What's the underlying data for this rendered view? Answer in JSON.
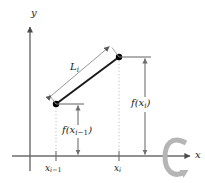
{
  "figure": {
    "type": "math-diagram",
    "axes": {
      "x_label": "x",
      "y_label": "y",
      "origin_px": [
        30,
        156
      ]
    },
    "labels": {
      "segment_length": "L",
      "segment_length_sub": "i",
      "f_left_name": "f(x",
      "f_left_sub": "i",
      "f_left_sub_op": "−1",
      "f_left_close": ")",
      "f_right_name": "f(x",
      "f_right_sub": "i",
      "f_right_close": ")",
      "tick_left": "x",
      "tick_left_sub": "i",
      "tick_left_sub_op": "−1",
      "tick_right": "x",
      "tick_right_sub": "i"
    },
    "colors": {
      "axis": "#6b6b6b",
      "curve": "#1a1a1a",
      "point": "#000000",
      "guide": "#9a9a9a",
      "dimension": "#7d7d7d",
      "dotted": "#b8b8b8",
      "rotation": "#b5b5b5",
      "text": "#1a1a1a",
      "background": "#ffffff"
    },
    "geometry": {
      "point_left_px": [
        56,
        104
      ],
      "point_right_px": [
        119,
        57
      ],
      "tick_left_x_px": 56,
      "tick_right_x_px": 119,
      "f_left_arrow_x_px": 78,
      "f_right_arrow_x_px": 145,
      "baseline_y_px": 156
    },
    "rotation_symbol": {
      "name": "rotation-arrow",
      "center_px": [
        178,
        157
      ],
      "direction": "counterclockwise-about-x-axis"
    }
  }
}
